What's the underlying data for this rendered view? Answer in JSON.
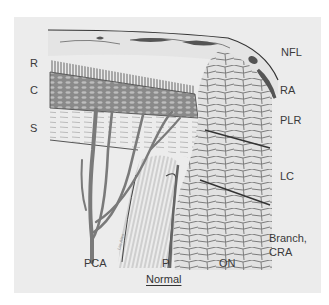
{
  "figure": {
    "caption": "Normal",
    "signature": "Lee Allen",
    "colors": {
      "page": "#ffffff",
      "panel": "#ececec",
      "ink": "#3a3a3a",
      "vessel": "#7a7a7a",
      "tissue": "#d8d8d8"
    },
    "left_labels": [
      {
        "id": "R",
        "text": "R"
      },
      {
        "id": "C",
        "text": "C"
      },
      {
        "id": "S",
        "text": "S"
      }
    ],
    "right_labels": [
      {
        "id": "NFL",
        "text": "NFL"
      },
      {
        "id": "RA",
        "text": "RA"
      },
      {
        "id": "PLR",
        "text": "PLR"
      },
      {
        "id": "LC",
        "text": "LC"
      },
      {
        "id": "Branch_CRA_1",
        "text": "Branch,"
      },
      {
        "id": "Branch_CRA_2",
        "text": "CRA"
      }
    ],
    "bottom_labels": [
      {
        "id": "PCA",
        "text": "PCA"
      },
      {
        "id": "P",
        "text": "P"
      },
      {
        "id": "ON",
        "text": "ON"
      }
    ]
  }
}
